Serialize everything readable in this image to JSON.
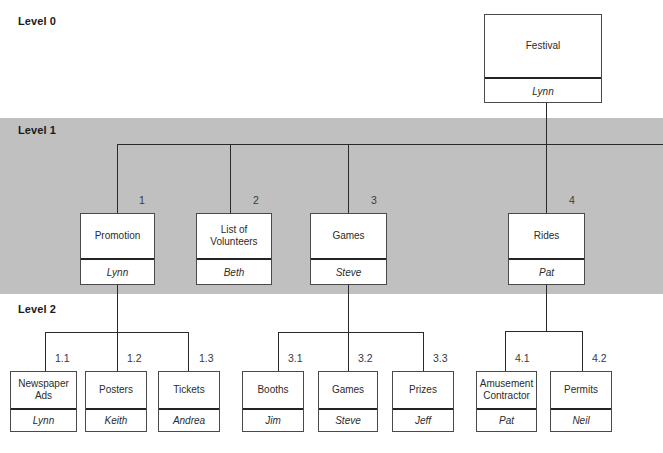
{
  "diagram": {
    "bands": {
      "level0_label": "Level 0",
      "level1_label": "Level 1",
      "level2_label": "Level 2"
    },
    "colors": {
      "band_gray": "#c0c0c0",
      "line": "#2a2a2a",
      "box_border": "#4a4a4a",
      "box_fill": "#ffffff",
      "text": "#2b2b2b"
    }
  },
  "root": {
    "code": "",
    "title": "Festival",
    "owner": "Lynn"
  },
  "level1": [
    {
      "code": "1",
      "title": "Promotion",
      "owner": "Lynn"
    },
    {
      "code": "2",
      "title": "List of Volunteers",
      "owner": "Beth"
    },
    {
      "code": "3",
      "title": "Games",
      "owner": "Steve"
    },
    {
      "code": "4",
      "title": "Rides",
      "owner": "Pat"
    }
  ],
  "level2": [
    {
      "code": "1.1",
      "title": "Newspaper Ads",
      "owner": "Lynn"
    },
    {
      "code": "1.2",
      "title": "Posters",
      "owner": "Keith"
    },
    {
      "code": "1.3",
      "title": "Tickets",
      "owner": "Andrea"
    },
    {
      "code": "3.1",
      "title": "Booths",
      "owner": "Jim"
    },
    {
      "code": "3.2",
      "title": "Games",
      "owner": "Steve"
    },
    {
      "code": "3.3",
      "title": "Prizes",
      "owner": "Jeff"
    },
    {
      "code": "4.1",
      "title": "Amusement Contractor",
      "owner": "Pat"
    },
    {
      "code": "4.2",
      "title": "Permits",
      "owner": "Neil"
    }
  ]
}
